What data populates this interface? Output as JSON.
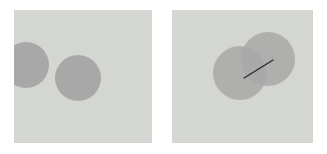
{
  "figure": {
    "title": "",
    "background_color": "#ffffff",
    "panel_count": 2
  },
  "panels": [
    {
      "id": "panel-left",
      "name": "disjoint-circles-panel",
      "caption": "",
      "background_color": "#d4d6d2",
      "x": 14,
      "y": 10,
      "width": 138,
      "height": 133,
      "shapes": [
        {
          "id": "circle-left-clipped",
          "name": "circle-a",
          "type": "circle",
          "cx": 12,
          "cy": 55,
          "r": 23,
          "fill": "#a8a8a8",
          "opacity": 1,
          "clipped_by_panel_edge": true
        },
        {
          "id": "circle-right",
          "name": "circle-b",
          "type": "circle",
          "cx": 64,
          "cy": 68,
          "r": 23,
          "fill": "#a8a8a8",
          "opacity": 1,
          "clipped_by_panel_edge": false
        }
      ],
      "lines": []
    },
    {
      "id": "panel-right",
      "name": "overlapping-circles-panel",
      "caption": "",
      "background_color": "#d4d6d2",
      "x": 172,
      "y": 10,
      "width": 141,
      "height": 133,
      "shapes": [
        {
          "id": "circle-lower-left",
          "name": "circle-a",
          "type": "circle",
          "cx": 68,
          "cy": 63,
          "r": 27,
          "fill": "#a8a8a8",
          "opacity": 0.85,
          "clipped_by_panel_edge": false
        },
        {
          "id": "circle-upper-right",
          "name": "circle-b",
          "type": "circle",
          "cx": 96,
          "cy": 49,
          "r": 27,
          "fill": "#a8a8a8",
          "opacity": 0.85,
          "clipped_by_panel_edge": false
        }
      ],
      "lines": [
        {
          "id": "intersection-segment",
          "name": "connector-line",
          "type": "segment",
          "x1": 72,
          "y1": 68,
          "x2": 101,
          "y2": 50,
          "stroke": "#2c2c2c",
          "stroke_width": 1.4
        }
      ]
    }
  ],
  "colors": {
    "page_background": "#ffffff",
    "panel_background": "#d4d6d2",
    "shape_fill": "#a8a8a8",
    "overlap_fill": "#9a9c98",
    "line_stroke": "#2c2c2c"
  }
}
